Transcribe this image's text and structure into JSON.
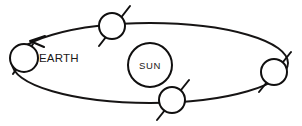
{
  "diagram": {
    "type": "orbital-diagram",
    "canvas": {
      "width": 302,
      "height": 126,
      "background": "#ffffff"
    },
    "stroke_color": "#100f0f",
    "fill_color": "#ffffff",
    "orbit": {
      "name": "earth-orbit-ellipse",
      "center_x": 150,
      "center_y": 63,
      "radius_x": 138,
      "radius_y": 40,
      "stroke_width": 1.9,
      "direction": "counterclockwise"
    },
    "sun": {
      "label": "SUN",
      "center_x": 150,
      "center_y": 65,
      "radius": 22
    },
    "earth_label": {
      "text": "EARTH",
      "x": 39,
      "y": 62
    },
    "direction_arrow": {
      "name": "orbit-direction-arrow",
      "tip_x": 30,
      "tip_y": 41,
      "points": "45,36 30,41 44,47"
    },
    "earth_positions": [
      {
        "id": "earth-position-left",
        "season_index": 1,
        "center_x": 24,
        "center_y": 58,
        "radius": 14,
        "axis": {
          "x1": 33,
          "y1": 44,
          "x2": 13,
          "y2": 74
        }
      },
      {
        "id": "earth-position-top",
        "season_index": 2,
        "center_x": 112,
        "center_y": 26,
        "radius": 13,
        "axis": {
          "x1": 130,
          "y1": 6,
          "x2": 99,
          "y2": 46
        }
      },
      {
        "id": "earth-position-right",
        "season_index": 3,
        "center_x": 274,
        "center_y": 72,
        "radius": 13,
        "axis": {
          "x1": 291,
          "y1": 52,
          "x2": 259,
          "y2": 92
        }
      },
      {
        "id": "earth-position-bottom",
        "season_index": 4,
        "center_x": 172,
        "center_y": 100,
        "radius": 13,
        "axis": {
          "x1": 189,
          "y1": 80,
          "x2": 157,
          "y2": 120
        }
      }
    ]
  }
}
